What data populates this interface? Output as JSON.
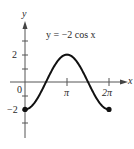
{
  "chart_data": {
    "type": "line",
    "title": "y = −2 cos x",
    "function": "y = -2cos(x)",
    "xlabel": "x",
    "ylabel": "y",
    "x_ticks": [
      {
        "value": 0,
        "label": "0"
      },
      {
        "value": 3.14159,
        "label": "π"
      },
      {
        "value": 6.28318,
        "label": "2π"
      }
    ],
    "y_ticks": [
      {
        "value": 2,
        "label": "2"
      },
      {
        "value": -2,
        "label": "−2"
      }
    ],
    "xlim": [
      0,
      6.28318
    ],
    "ylim": [
      -3,
      3
    ],
    "grid": false,
    "legend": null,
    "endpoints": [
      {
        "x": 0,
        "y": -2,
        "marker": "filled-dot"
      },
      {
        "x": 6.28318,
        "y": -2,
        "marker": "filled-dot"
      }
    ],
    "series": [
      {
        "name": "y = −2 cos x",
        "x": [
          0,
          0.785,
          1.571,
          2.356,
          3.142,
          3.927,
          4.712,
          5.498,
          6.283
        ],
        "values": [
          -2,
          -1.414,
          0,
          1.414,
          2,
          1.414,
          0,
          -1.414,
          -2
        ]
      }
    ]
  },
  "labels": {
    "equation": "y = −2 cos x",
    "y_axis": "y",
    "x_axis": "x",
    "origin": "0",
    "y_pos2": "2",
    "y_neg2": "−2",
    "x_pi": "π",
    "x_2pi": "2π"
  },
  "colors": {
    "curve": "#111111",
    "axis": "#555555",
    "text": "#2a2a2a"
  }
}
